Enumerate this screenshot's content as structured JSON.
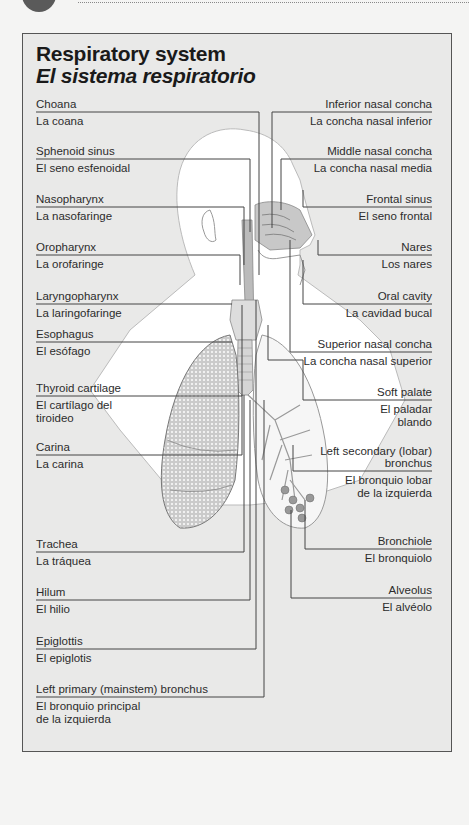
{
  "title": {
    "english": "Respiratory system",
    "spanish": "El sistema respiratorio"
  },
  "left_labels": [
    {
      "en": "Choana",
      "es": "La coana"
    },
    {
      "en": "Sphenoid sinus",
      "es": "El seno esfenoidal"
    },
    {
      "en": "Nasopharynx",
      "es": "La nasofaringe"
    },
    {
      "en": "Oropharynx",
      "es": "La orofaringe"
    },
    {
      "en": "Laryngopharynx",
      "es": "La laringofaringe"
    },
    {
      "en": "Esophagus",
      "es": "El esófago"
    },
    {
      "en": "Thyroid cartilage",
      "es": "El cartílago del tiroideo",
      "es_line1": "El cartílago del",
      "es_line2": "tiroideo"
    },
    {
      "en": "Carina",
      "es": "La carina"
    },
    {
      "en": "Trachea",
      "es": "La tráquea"
    },
    {
      "en": "Hilum",
      "es": "El hilio"
    },
    {
      "en": "Epiglottis",
      "es": "El epiglotis"
    },
    {
      "en": "Left primary (mainstem) bronchus",
      "es": "El bronquio principal de la izquierda",
      "es_line1": "El bronquio principal",
      "es_line2": "de la izquierda"
    }
  ],
  "right_labels": [
    {
      "en": "Inferior nasal concha",
      "es": "La concha nasal inferior"
    },
    {
      "en": "Middle nasal concha",
      "es": "La concha nasal media"
    },
    {
      "en": "Frontal sinus",
      "es": "El seno frontal"
    },
    {
      "en": "Nares",
      "es": "Los nares"
    },
    {
      "en": "Oral cavity",
      "es": "La cavidad bucal"
    },
    {
      "en": "Superior nasal concha",
      "es": "La concha nasal superior"
    },
    {
      "en": "Soft palate",
      "es": "El paladar blando",
      "es_line1": "El paladar",
      "es_line2": "blando"
    },
    {
      "en": "Left secondary (lobar) bronchus",
      "es": "El bronquio lobar de la izquierda",
      "en_line1": "Left secondary (lobar)",
      "en_line2": "bronchus",
      "es_line1": "El bronquio lobar",
      "es_line2": "de la izquierda"
    },
    {
      "en": "Bronchiole",
      "es": "El bronquiolo"
    },
    {
      "en": "Alveolus",
      "es": "El alvéolo"
    }
  ]
}
